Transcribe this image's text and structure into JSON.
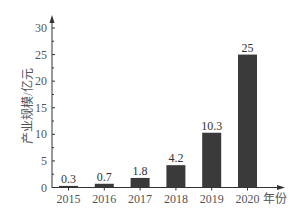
{
  "chart_data": {
    "type": "bar",
    "title": "",
    "xlabel": "年份",
    "ylabel": "产业规模/亿元",
    "categories": [
      "2015",
      "2016",
      "2017",
      "2018",
      "2019",
      "2020"
    ],
    "values": [
      0.3,
      0.7,
      1.8,
      4.2,
      10.3,
      25
    ],
    "value_labels": [
      "0.3",
      "0.7",
      "1.8",
      "4.2",
      "10.3",
      "25"
    ],
    "ylim": [
      0,
      30
    ],
    "yticks": [
      0,
      5,
      10,
      15,
      20,
      25,
      30
    ],
    "grid": false,
    "legend": null,
    "bar_color": "#3a3a3a"
  }
}
